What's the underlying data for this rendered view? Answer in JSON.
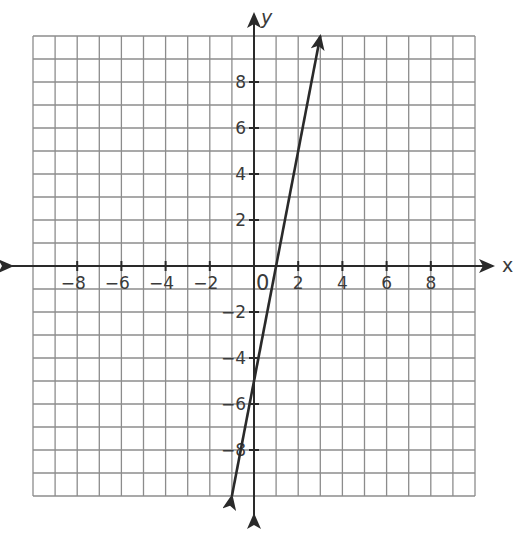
{
  "chart_data": {
    "type": "line",
    "title": "",
    "xlabel": "x",
    "ylabel": "y",
    "xlim": [
      -10,
      10
    ],
    "ylim": [
      -10,
      10
    ],
    "grid": true,
    "grid_step": 1,
    "origin_label": "0",
    "x_ticks": [
      -8,
      -6,
      -4,
      -2,
      2,
      4,
      6,
      8
    ],
    "x_tick_labels": [
      "−8",
      "−6",
      "−4",
      "−2",
      "2",
      "4",
      "6",
      "8"
    ],
    "y_ticks": [
      8,
      6,
      4,
      2,
      -2,
      -4,
      -6,
      -8
    ],
    "y_tick_labels": [
      "8",
      "6",
      "4",
      "2",
      "−2",
      "−4",
      "−6",
      "−8"
    ],
    "series": [
      {
        "name": "line",
        "equation": "y = 5x - 5",
        "slope": 5,
        "intercept": -5,
        "x": [
          -1,
          0,
          1,
          3
        ],
        "y": [
          -10,
          -5,
          0,
          10
        ],
        "arrows_both_ends": true,
        "color": "#2a2a2a"
      }
    ],
    "colors": {
      "grid": "#8c8c8c",
      "axis": "#2a2a2a",
      "line": "#2a2a2a",
      "text": "#3a3a3a"
    }
  }
}
